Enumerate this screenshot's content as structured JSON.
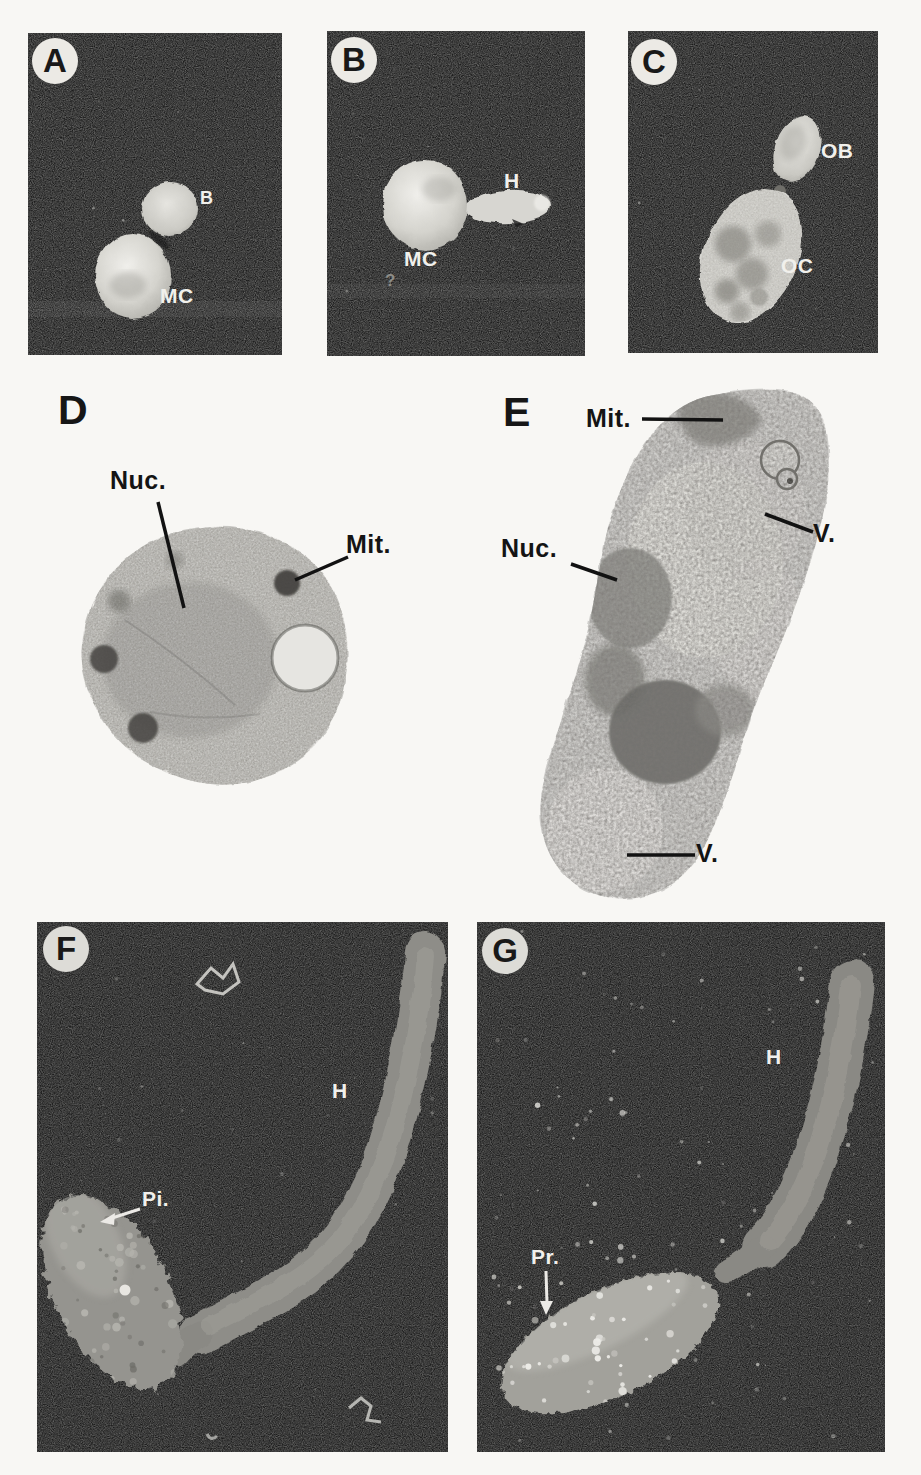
{
  "figure_kind": "micrograph-plate",
  "colors": {
    "page_bg": "#f8f7f4",
    "panel_bg": "#1c1c1c",
    "badge_bg": "#eceae5",
    "badge_text": "#191919",
    "label_light": "#f1f0ec",
    "label_dark": "#141414"
  },
  "panels": {
    "A": {
      "badge": "A",
      "labels": {
        "bud": "B",
        "mother_cell": "MC"
      }
    },
    "B": {
      "badge": "B",
      "labels": {
        "hypha": "H",
        "mother_cell": "MC"
      },
      "debris_mark": "?"
    },
    "C": {
      "badge": "C",
      "labels": {
        "oval_bud": "OB",
        "oval_cell": "OC"
      }
    },
    "D": {
      "letter": "D",
      "labels": {
        "nucleus": "Nuc.",
        "mitochondrion": "Mit."
      }
    },
    "E": {
      "letter": "E",
      "labels": {
        "mitochondrion": "Mit.",
        "vacuole_upper": "V.",
        "nucleus": "Nuc.",
        "vacuole_lower": "V."
      }
    },
    "F": {
      "badge": "F",
      "labels": {
        "pimples": "Pi.",
        "hypha": "H"
      }
    },
    "G": {
      "badge": "G",
      "labels": {
        "protuberances": "Pr.",
        "hypha": "H"
      }
    }
  }
}
